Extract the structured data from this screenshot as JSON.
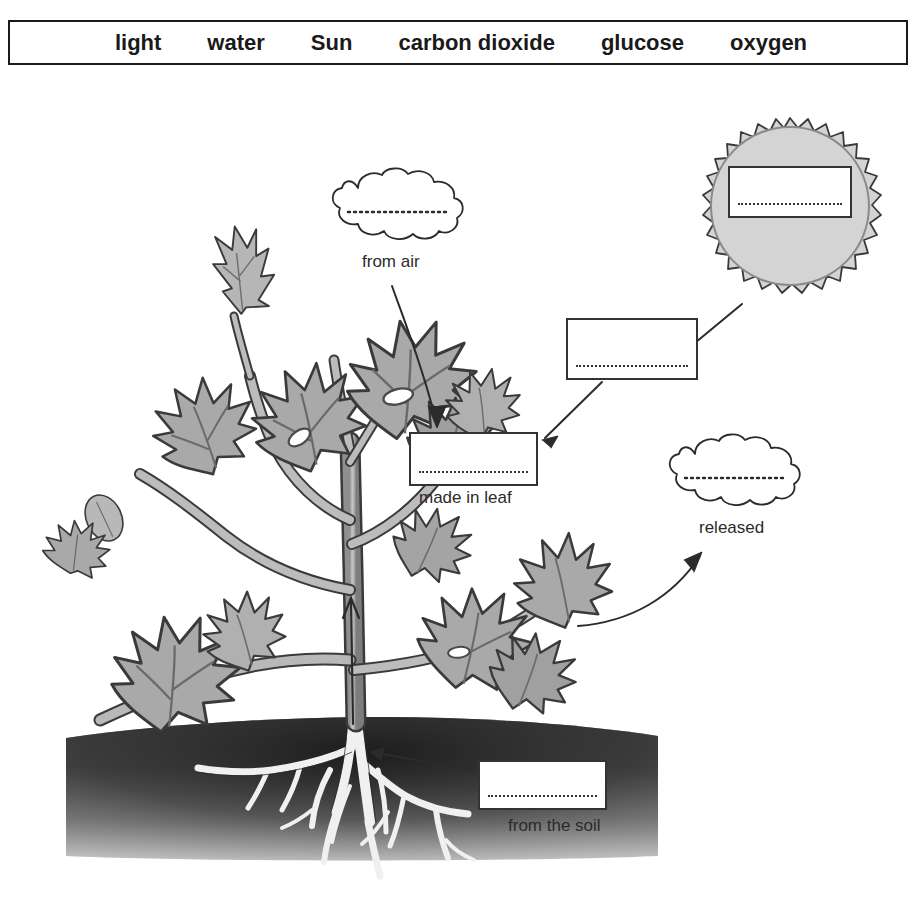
{
  "word_bank": {
    "name": "word-bank",
    "words": [
      "light",
      "water",
      "Sun",
      "carbon dioxide",
      "glucose",
      "oxygen"
    ]
  },
  "diagram": {
    "blanks": [
      {
        "id": "sun-blank",
        "shape": "rectangle-in-sun",
        "value": "",
        "caption": ""
      },
      {
        "id": "from-air-blank",
        "shape": "cloud",
        "value": "",
        "caption": "from air"
      },
      {
        "id": "light-blank",
        "shape": "rectangle",
        "value": "",
        "caption": ""
      },
      {
        "id": "made-in-leaf-blank",
        "shape": "rectangle",
        "value": "",
        "caption": "made in leaf"
      },
      {
        "id": "released-blank",
        "shape": "cloud",
        "value": "",
        "caption": "released"
      },
      {
        "id": "from-the-soil-blank",
        "shape": "rectangle",
        "value": "",
        "caption": "from the soil"
      }
    ],
    "captions": {
      "from_air": "from air",
      "made_in_leaf": "made in leaf",
      "released": "released",
      "from_the_soil": "from the soil"
    }
  },
  "colors": {
    "ink": "#1a1a1a",
    "box_border": "#333333",
    "leaf_fill": "#a9a9a9",
    "leaf_fill_light": "#c2c2c2",
    "leaf_outline": "#3a3a3a",
    "stem_fill": "#b5b5b5",
    "sun_fill": "#d2d2d2",
    "soil_dark": "#2e2e2e",
    "soil_light": "#b0b0b0",
    "root_fill": "#f2f2f2",
    "page_bg": "#ffffff"
  }
}
